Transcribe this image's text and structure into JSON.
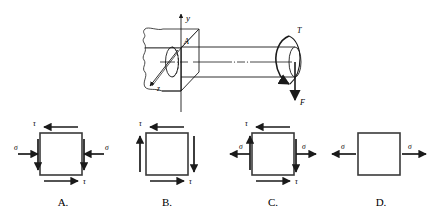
{
  "figure": {
    "title_text": "",
    "axes": {
      "y_label": "y",
      "z_label": "z"
    },
    "point_label": "A",
    "loads": {
      "torque_label": "T",
      "force_label": "F"
    },
    "colors": {
      "line": "#1a1a1a",
      "background": "#ffffff"
    }
  },
  "options": [
    {
      "id": "A",
      "label": "A.",
      "normal_stress_label": "σ",
      "shear_stress_label": "τ",
      "normal_direction": "inward",
      "shear_top_direction": "left",
      "shear_bottom_direction": "right",
      "side_vertical_left": "down",
      "side_vertical_right": "down",
      "has_normal": true,
      "has_shear": true
    },
    {
      "id": "B",
      "label": "B.",
      "normal_stress_label": "",
      "shear_stress_label": "τ",
      "normal_direction": "none",
      "shear_top_direction": "left",
      "shear_bottom_direction": "right",
      "side_vertical_left": "up",
      "side_vertical_right": "down",
      "has_normal": false,
      "has_shear": true
    },
    {
      "id": "C",
      "label": "C.",
      "normal_stress_label": "σ",
      "shear_stress_label": "τ",
      "normal_direction": "outward",
      "shear_top_direction": "left",
      "shear_bottom_direction": "right",
      "side_vertical_left": "up",
      "side_vertical_right": "down",
      "has_normal": true,
      "has_shear": true
    },
    {
      "id": "D",
      "label": "D.",
      "normal_stress_label": "σ",
      "shear_stress_label": "",
      "normal_direction": "outward",
      "shear_top_direction": "none",
      "shear_bottom_direction": "none",
      "side_vertical_left": "none",
      "side_vertical_right": "none",
      "has_normal": true,
      "has_shear": false
    }
  ]
}
